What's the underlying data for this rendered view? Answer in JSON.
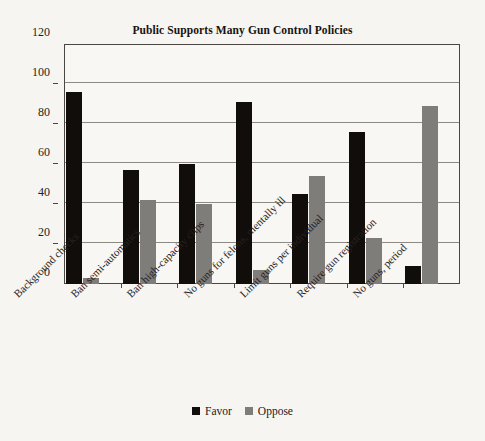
{
  "chart_data": {
    "type": "bar",
    "title": "Public Supports Many Gun Control Policies",
    "xlabel": "",
    "ylabel": "",
    "ylim": [
      0,
      120
    ],
    "ytick_step": 20,
    "yticks": [
      0,
      20,
      40,
      60,
      80,
      100,
      120
    ],
    "ytick_labels": [
      "0",
      "20",
      "40",
      "60",
      "80",
      "100",
      "120"
    ],
    "grid": true,
    "grid_axis": "y",
    "legend_position": "bottom-center",
    "xtick_label_rotation": -45,
    "categories": [
      "Background checks",
      "Ban semi-automatics",
      "Ban high-capacity clips",
      "No guns for felons, mentally ill",
      "Limit guns per individual",
      "Require gun registration",
      "No guns, period"
    ],
    "series": [
      {
        "name": "Favor",
        "color": "#100d0a",
        "values": [
          96,
          57,
          60,
          91,
          45,
          76,
          9
        ]
      },
      {
        "name": "Oppose",
        "color": "#7f7d79",
        "values": [
          3,
          42,
          40,
          7,
          54,
          23,
          89
        ]
      }
    ]
  },
  "legend": {
    "entries": [
      {
        "label": "Favor",
        "swatch": "favor-swatch"
      },
      {
        "label": "Oppose",
        "swatch": "oppose-swatch"
      }
    ]
  },
  "colors": {
    "background": "#f6f5f2",
    "plot_background": "#f8f7f4",
    "axis": "#4a4742",
    "gridline": "#8d8a85",
    "favor": "#100d0a",
    "oppose": "#7f7d79",
    "text": "#16130f"
  }
}
